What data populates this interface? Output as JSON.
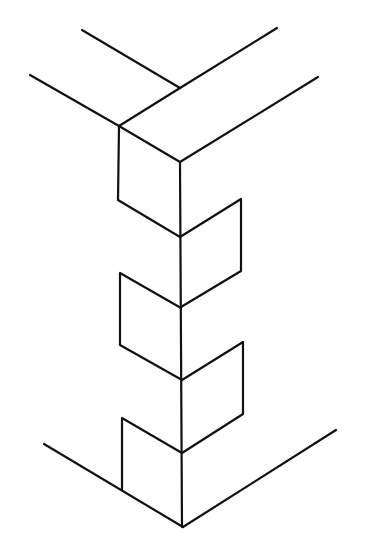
{
  "diagram": {
    "kind": "isometric line drawing of a corner joint with interlocking notches",
    "stroke_color": "#111111",
    "background": "#ffffff",
    "stroke_width": 2.2,
    "segments": [
      {
        "name": "top-back-left-edge",
        "points": [
          [
            82,
            30
          ],
          [
            180,
            88
          ]
        ]
      },
      {
        "name": "top-back-right-edge",
        "points": [
          [
            180,
            88
          ],
          [
            277,
            28
          ]
        ]
      },
      {
        "name": "top-front-left-edge",
        "points": [
          [
            30,
            75
          ],
          [
            119,
            126
          ]
        ]
      },
      {
        "name": "top-inner-edge",
        "points": [
          [
            119,
            126
          ],
          [
            180,
            88
          ]
        ]
      },
      {
        "name": "top-front-corner-edge",
        "points": [
          [
            119,
            126
          ],
          [
            180,
            162
          ]
        ]
      },
      {
        "name": "top-front-right-edge",
        "points": [
          [
            180,
            162
          ],
          [
            318,
            77
          ]
        ]
      },
      {
        "name": "center-vertical-edge",
        "points": [
          [
            180,
            162
          ],
          [
            182,
            527
          ]
        ]
      },
      {
        "name": "notch-1-left",
        "points": [
          [
            119,
            126
          ],
          [
            118,
            200
          ],
          [
            180,
            237
          ]
        ]
      },
      {
        "name": "notch-2-right",
        "points": [
          [
            180,
            237
          ],
          [
            241,
            199
          ],
          [
            241,
            271
          ],
          [
            181,
            307
          ]
        ]
      },
      {
        "name": "notch-3-left",
        "points": [
          [
            181,
            308
          ],
          [
            120,
            273
          ],
          [
            120,
            345
          ],
          [
            182,
            380
          ]
        ]
      },
      {
        "name": "notch-4-right",
        "points": [
          [
            182,
            380
          ],
          [
            243,
            342
          ],
          [
            243,
            414
          ],
          [
            182,
            453
          ]
        ]
      },
      {
        "name": "notch-5-left",
        "points": [
          [
            182,
            453
          ],
          [
            122,
            418
          ],
          [
            122,
            490
          ]
        ]
      },
      {
        "name": "bottom-left-edge",
        "points": [
          [
            44,
            444
          ],
          [
            183,
            527
          ]
        ]
      },
      {
        "name": "bottom-right-edge",
        "points": [
          [
            183,
            527
          ],
          [
            336,
            430
          ]
        ]
      }
    ]
  }
}
